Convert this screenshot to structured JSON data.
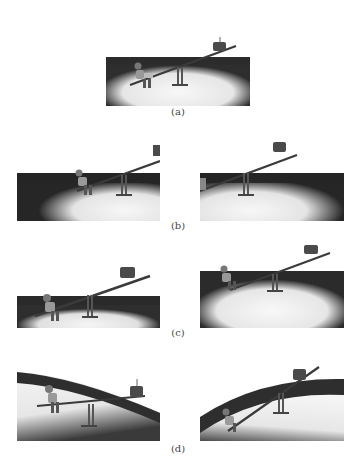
{
  "figure": {
    "rows": [
      {
        "caption": "(a)",
        "panels": [
          {
            "id": "a",
            "tilt": -18,
            "scene": "seesaw-character-high-weight",
            "camera": "front"
          }
        ]
      },
      {
        "caption": "(b)",
        "panels": [
          {
            "id": "b-left",
            "tilt": -20,
            "scene": "seesaw-character-high-weight",
            "camera": "pan-left"
          },
          {
            "id": "b-right",
            "tilt": -20,
            "scene": "seesaw-character-high-weight",
            "camera": "pan-right"
          }
        ]
      },
      {
        "caption": "(c)",
        "panels": [
          {
            "id": "c-left",
            "tilt": -20,
            "scene": "seesaw-character-high-weight",
            "camera": "zoom-in"
          },
          {
            "id": "c-right",
            "tilt": -18,
            "scene": "seesaw-character-high-weight",
            "camera": "zoom-out"
          }
        ]
      },
      {
        "caption": "(d)",
        "panels": [
          {
            "id": "d-left",
            "tilt": -3,
            "scene": "seesaw-level",
            "camera": "tilted-horizon"
          },
          {
            "id": "d-right",
            "tilt": -38,
            "scene": "seesaw-steep",
            "camera": "tilted-horizon"
          }
        ]
      }
    ],
    "colors": {
      "background": "#ffffff",
      "floor_dark": "#2e2e2e",
      "spotlight": "#f2f2f2",
      "seesaw": "#3a3a3a",
      "caption": "#444444"
    }
  }
}
